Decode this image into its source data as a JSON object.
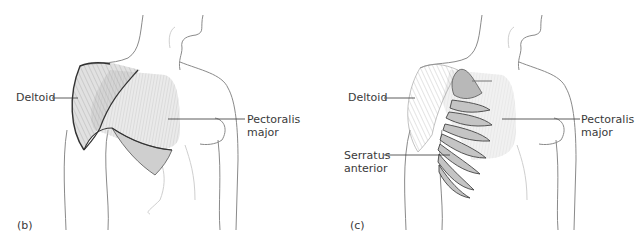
{
  "panels": [
    {
      "id": "b",
      "letter": "(b)",
      "labels": {
        "deltoid": "Deltoid",
        "pectoralis_line1": "Pectoralis",
        "pectoralis_line2": "major"
      }
    },
    {
      "id": "c",
      "letter": "(c)",
      "labels": {
        "deltoid": "Deltoid",
        "pectoralis_line1": "Pectoralis",
        "pectoralis_line2": "major",
        "serratus_line1": "Serratus",
        "serratus_line2": "anterior"
      }
    }
  ],
  "colors": {
    "outline": "#8a8a8a",
    "muscle_fill": "#c8c8c8",
    "muscle_dark": "#3a3a3a",
    "text": "#3a3a3a"
  }
}
